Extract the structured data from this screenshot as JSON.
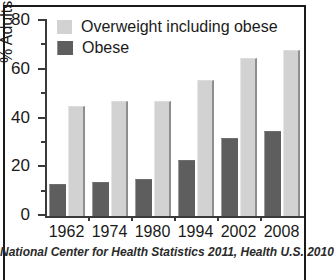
{
  "chart_data": {
    "type": "bar",
    "title": "",
    "xlabel": "",
    "ylabel": "% Adults ages 20-74",
    "categories": [
      "1962",
      "1974",
      "1980",
      "1994",
      "2002",
      "2008"
    ],
    "series": [
      {
        "name": "Overweight including obese",
        "color": "#d2d2d2",
        "values": [
          45,
          47,
          47,
          56,
          65,
          68
        ]
      },
      {
        "name": "Obese",
        "color": "#5e5e5e",
        "values": [
          13,
          14,
          15,
          23,
          32,
          35
        ]
      }
    ],
    "ylim": [
      0,
      80
    ],
    "ytick_major": [
      0,
      20,
      40,
      60,
      80
    ],
    "ytick_minor": [
      10,
      30,
      50,
      70
    ],
    "grid": false,
    "legend_position": "top-left",
    "source_note": "National Center for Health Statistics 2011, Health U.S. 2010"
  },
  "legend": {
    "items": [
      {
        "label": "Overweight including obese",
        "swatch": "overweight"
      },
      {
        "label": "Obese",
        "swatch": "obese"
      }
    ]
  },
  "footnote": {
    "text": "National Center for Health Statistics 2011, Health U.S. 2010"
  },
  "colors": {
    "overweight": "#d2d2d2",
    "obese": "#5e5e5e",
    "axis": "#3a3a3a",
    "frame": "#1a1a1a",
    "background": "#ffffff"
  }
}
